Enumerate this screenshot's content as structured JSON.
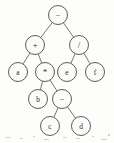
{
  "figure": {
    "kind": "binary-expression-tree",
    "expression": "(a + b * (c - d)) - (e / f)",
    "background_color": "#fdfdfc",
    "node_fill_color": "#fbfbfa",
    "node_stroke_color": "#4a4a4a",
    "edge_color": "#5d5d5d",
    "label_color": "#2b2b2b"
  },
  "tree": {
    "node_radius": 9.5,
    "nodes": [
      {
        "id": "n0",
        "label": "−",
        "kind": "operator",
        "x": 58,
        "y": 15,
        "level": 0
      },
      {
        "id": "n1",
        "label": "+",
        "kind": "operator",
        "x": 35,
        "y": 45,
        "level": 1
      },
      {
        "id": "n2",
        "label": "/",
        "kind": "operator",
        "x": 79,
        "y": 45,
        "level": 1
      },
      {
        "id": "n3",
        "label": "a",
        "kind": "operand",
        "x": 18,
        "y": 72,
        "level": 2
      },
      {
        "id": "n4",
        "label": "*",
        "kind": "operator",
        "x": 45,
        "y": 72,
        "level": 2
      },
      {
        "id": "n5",
        "label": "e",
        "kind": "operand",
        "x": 67,
        "y": 72,
        "level": 2
      },
      {
        "id": "n6",
        "label": "f",
        "kind": "operand",
        "x": 95,
        "y": 72,
        "level": 2
      },
      {
        "id": "n7",
        "label": "b",
        "kind": "operand",
        "x": 38,
        "y": 99,
        "level": 3
      },
      {
        "id": "n8",
        "label": "−",
        "kind": "operator",
        "x": 62,
        "y": 99,
        "level": 3
      },
      {
        "id": "n9",
        "label": "c",
        "kind": "operand",
        "x": 50,
        "y": 126,
        "level": 4
      },
      {
        "id": "n10",
        "label": "d",
        "kind": "operand",
        "x": 81,
        "y": 126,
        "level": 4
      }
    ],
    "edges": [
      {
        "from": "n0",
        "to": "n1"
      },
      {
        "from": "n0",
        "to": "n2"
      },
      {
        "from": "n1",
        "to": "n3"
      },
      {
        "from": "n1",
        "to": "n4"
      },
      {
        "from": "n2",
        "to": "n5"
      },
      {
        "from": "n2",
        "to": "n6"
      },
      {
        "from": "n4",
        "to": "n7"
      },
      {
        "from": "n4",
        "to": "n8"
      },
      {
        "from": "n8",
        "to": "n9"
      },
      {
        "from": "n8",
        "to": "n10"
      }
    ]
  },
  "scan_artifacts": {
    "specks": [
      {
        "x": 6,
        "y": 137,
        "w": 4,
        "h": 1
      },
      {
        "x": 20,
        "y": 138,
        "w": 3,
        "h": 1
      },
      {
        "x": 33,
        "y": 136,
        "w": 2,
        "h": 1
      },
      {
        "x": 44,
        "y": 139,
        "w": 5,
        "h": 1
      },
      {
        "x": 63,
        "y": 137,
        "w": 3,
        "h": 1
      },
      {
        "x": 76,
        "y": 138,
        "w": 4,
        "h": 1
      },
      {
        "x": 92,
        "y": 136,
        "w": 2,
        "h": 1
      },
      {
        "x": 101,
        "y": 139,
        "w": 6,
        "h": 1
      },
      {
        "x": 108,
        "y": 134,
        "w": 2,
        "h": 2
      }
    ]
  }
}
